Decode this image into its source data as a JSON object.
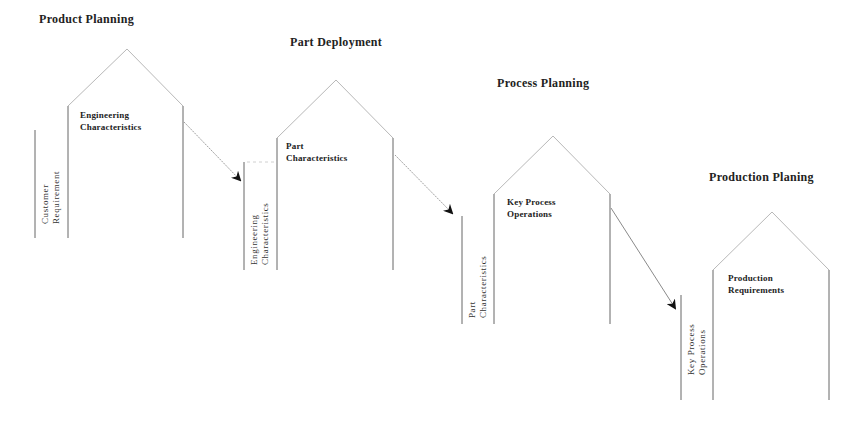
{
  "diagram": {
    "stages": [
      {
        "title": "Product Planning",
        "house_label": [
          "Engineering",
          "Characteristics"
        ],
        "side_label": [
          "Customer",
          "Requirement"
        ]
      },
      {
        "title": "Part Deployment",
        "house_label": [
          "Part",
          "Characteristics"
        ],
        "side_label": [
          "Engineering",
          "Characteristics"
        ]
      },
      {
        "title": "Process Planning",
        "house_label": [
          "Key Process",
          "Operations"
        ],
        "side_label": [
          "Part",
          "Characteristics"
        ]
      },
      {
        "title": "Production Planing",
        "house_label": [
          "Production",
          "Requirements"
        ],
        "side_label": [
          "Key Process",
          "Operations"
        ]
      }
    ],
    "colors": {
      "line": "#7a7a7a",
      "roof": "#b5b5b5",
      "arrow": "#9a9a9a",
      "arrowhead": "#111111",
      "text": "#222222"
    }
  }
}
